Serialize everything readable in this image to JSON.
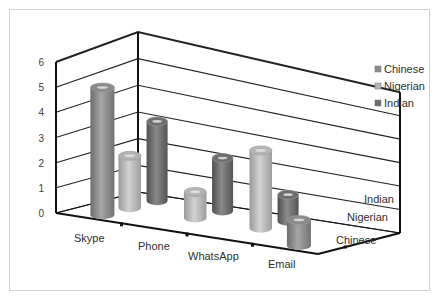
{
  "chart_data": {
    "type": "bar",
    "subtype": "3d-cylinder",
    "title": "",
    "xlabel": "",
    "ylabel": "",
    "ylim": [
      0,
      6
    ],
    "yticks": [
      "0",
      "1",
      "2",
      "3",
      "4",
      "5",
      "6"
    ],
    "categories": [
      "Skype",
      "Phone",
      "WhatsApp",
      "Email"
    ],
    "depth_labels": [
      "Chinese",
      "Nigerian",
      "Indian"
    ],
    "series": [
      {
        "name": "Chinese",
        "values": [
          5,
          0,
          0,
          1
        ],
        "color": "#8a8a8a"
      },
      {
        "name": "Nigerian",
        "values": [
          2,
          1,
          3,
          0
        ],
        "color": "#b4b4b4"
      },
      {
        "name": "Indian",
        "values": [
          3,
          2,
          1,
          0
        ],
        "color": "#6e6e6e"
      }
    ],
    "grid": true,
    "legend_position": "right"
  },
  "legend": {
    "items": [
      {
        "label": "Chinese"
      },
      {
        "label": "Nigerian"
      },
      {
        "label": "Indian"
      }
    ]
  }
}
